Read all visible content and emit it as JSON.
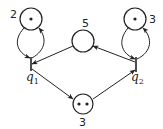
{
  "diagram": {
    "type": "petri-net",
    "colors": {
      "stroke": "#222222",
      "background": "#ffffff"
    },
    "places": [
      {
        "id": "p_top_left",
        "label": "2",
        "tokens": 1
      },
      {
        "id": "p_top_right",
        "label": "3",
        "tokens": 1
      },
      {
        "id": "p_center",
        "label": "5",
        "tokens": 0
      },
      {
        "id": "p_bottom",
        "label": "3",
        "tokens": 2
      }
    ],
    "transitions": [
      {
        "id": "q1",
        "label": "q",
        "subscript": "1"
      },
      {
        "id": "q2",
        "label": "q",
        "subscript": "2"
      }
    ],
    "arcs": [
      {
        "from": "p_top_left",
        "to": "q1"
      },
      {
        "from": "q1",
        "to": "p_top_left"
      },
      {
        "from": "p_center",
        "to": "q1"
      },
      {
        "from": "q1",
        "to": "p_bottom"
      },
      {
        "from": "p_bottom",
        "to": "q2"
      },
      {
        "from": "q2",
        "to": "p_center"
      },
      {
        "from": "p_top_right",
        "to": "q2"
      },
      {
        "from": "q2",
        "to": "p_top_right"
      }
    ]
  }
}
